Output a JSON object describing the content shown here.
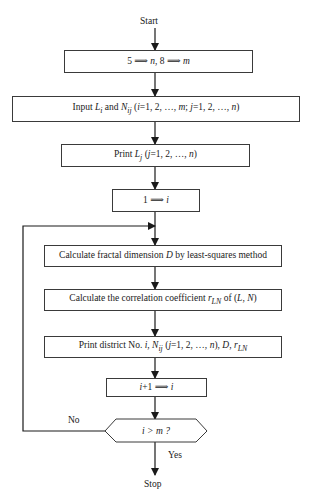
{
  "flowchart": {
    "start": "Start",
    "stop": "Stop",
    "steps": [
      {
        "id": "init",
        "text": "5 ⟹ n, 8 ⟹ m"
      },
      {
        "id": "input",
        "text": "Input Lᵢ and Nᵢⱼ (i=1, 2, …, m; j=1, 2, …, n)"
      },
      {
        "id": "print-l",
        "text": "Print Lⱼ (j=1, 2, …, n)"
      },
      {
        "id": "set-i",
        "text": "1 ⟹ i"
      },
      {
        "id": "calc-d",
        "text": "Calculate fractal dimension D by least-squares method"
      },
      {
        "id": "calc-r",
        "text": "Calculate the correlation coefficient r_LN of (L, N)"
      },
      {
        "id": "print-district",
        "text": "Print district No. i, Nᵢⱼ (j=1, 2, …, n), D, r_LN"
      },
      {
        "id": "increment",
        "text": "i+1 ⟹ i"
      }
    ],
    "decision": {
      "text": "i > m ?",
      "yes": "Yes",
      "no": "No"
    }
  },
  "colors": {
    "stroke": "#3a3a3a",
    "background": "#ffffff",
    "text": "#1a1a1a"
  }
}
